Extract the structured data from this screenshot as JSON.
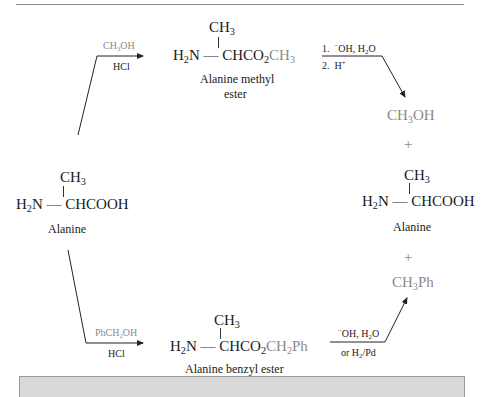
{
  "diagram": {
    "starting_material": {
      "name": "Alanine",
      "substituent": "CH3",
      "left_group": "H2N",
      "backbone": "CHCOOH"
    },
    "upper_route": {
      "reagent_top": "CH3OH",
      "reagent_bottom": "HCl",
      "product": {
        "name_line1": "Alanine methyl",
        "name_line2": "ester",
        "substituent": "CH3",
        "left_group": "H2N",
        "backbone": "CHCO2",
        "ester_group": "CH3"
      },
      "step1": "1.",
      "step1_reagents": "−OH, H2O",
      "step2": "2.",
      "step2_reagents": "H+"
    },
    "lower_route": {
      "reagent_top": "PhCH2OH",
      "reagent_bottom": "HCl",
      "product": {
        "name": "Alanine benzyl ester",
        "substituent": "CH3",
        "left_group": "H2N",
        "backbone": "CHCO2",
        "ester_group": "CH2Ph"
      },
      "reagent_top2": "−OH, H2O",
      "reagent_bottom2": "or H2/Pd"
    },
    "products": {
      "methanol": "CH3OH",
      "plus1": "+",
      "alanine": {
        "name": "Alanine",
        "substituent": "CH3",
        "left_group": "H2N",
        "backbone": "CHCOOH"
      },
      "plus2": "+",
      "toluene": "CH3Ph"
    },
    "colors": {
      "text": "#1a1a1a",
      "highlight_gray": "#8a8a8a",
      "bottom_bar": "#d9d9d9"
    }
  }
}
